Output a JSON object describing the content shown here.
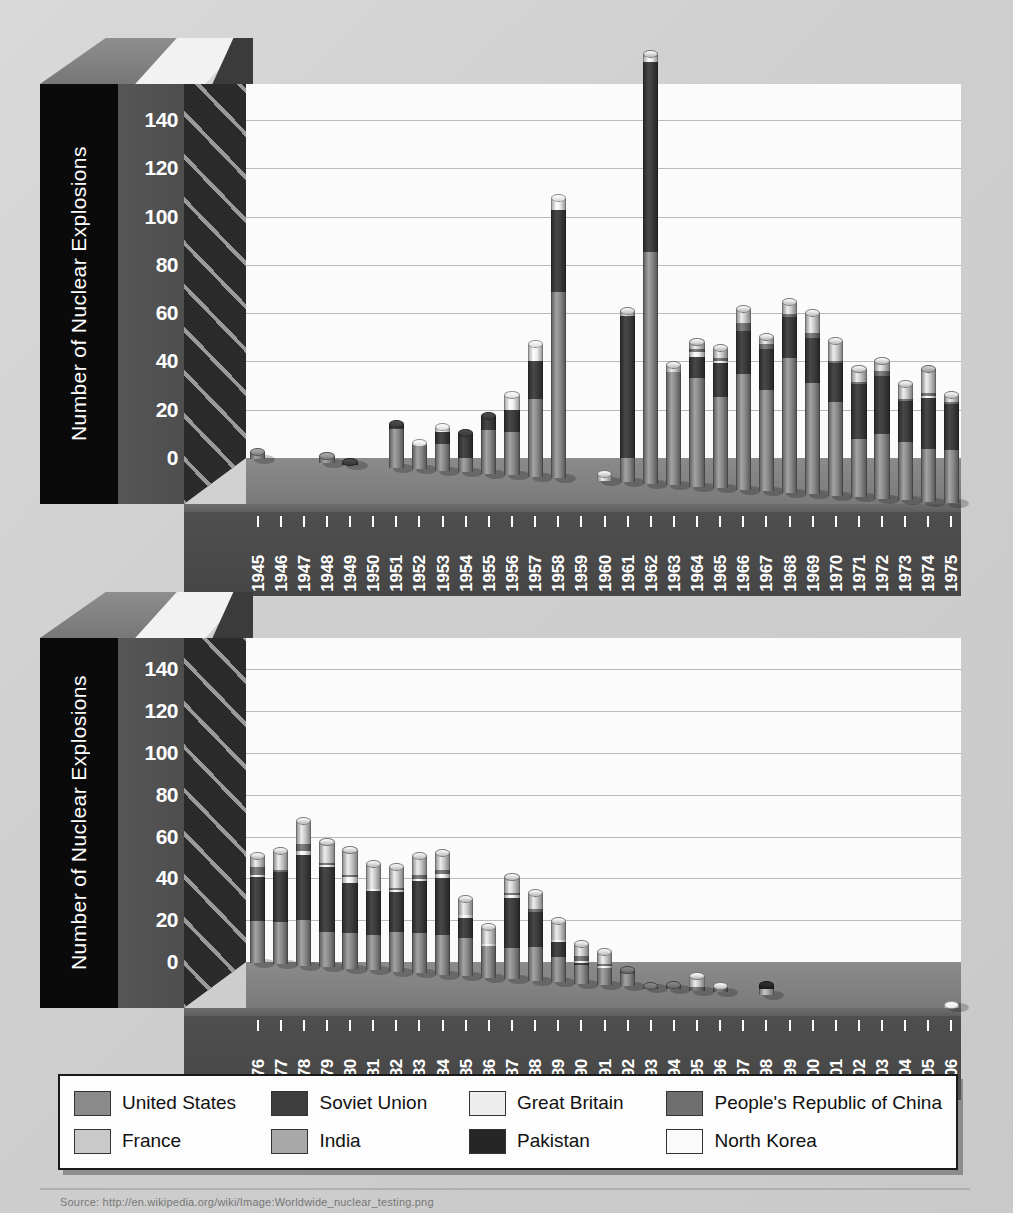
{
  "figure": {
    "background_color": "#d4d4d4",
    "caption": "Source: http://en.wikipedia.org/wiki/Image:Worldwide_nuclear_testing.png"
  },
  "legend": {
    "name": "country-legend",
    "items": [
      {
        "label": "United States",
        "color": "#8a8a8a"
      },
      {
        "label": "Soviet Union",
        "color": "#3d3d3d"
      },
      {
        "label": "Great Britain",
        "color": "#ededed"
      },
      {
        "label": "People's Republic of China",
        "color": "#6f6f6f"
      },
      {
        "label": "France",
        "color": "#c9c9c9"
      },
      {
        "label": "India",
        "color": "#a8a8a8"
      },
      {
        "label": "Pakistan",
        "color": "#262626"
      },
      {
        "label": "North Korea",
        "color": "#fbfbfb"
      }
    ]
  },
  "charts": [
    {
      "id": "chart-1945-1975",
      "ylabel": "Number of Nuclear Explosions",
      "yticks": [
        0,
        20,
        40,
        60,
        80,
        100,
        120,
        140
      ]
    },
    {
      "id": "chart-1976-2006",
      "ylabel": "Number of Nuclear Explosions",
      "yticks": [
        0,
        20,
        40,
        60,
        80,
        100,
        120,
        140
      ]
    }
  ],
  "chart_data": [
    {
      "type": "bar",
      "stacked": true,
      "title": "Worldwide nuclear explosions 1945-1975",
      "xlabel": "",
      "ylabel": "Number of Nuclear Explosions",
      "ylim": [
        0,
        155
      ],
      "yticks": [
        0,
        20,
        40,
        60,
        80,
        100,
        120,
        140
      ],
      "grid": true,
      "legend_position": "below-figure",
      "categories": [
        "1945",
        "1946",
        "1947",
        "1948",
        "1949",
        "1950",
        "1951",
        "1952",
        "1953",
        "1954",
        "1955",
        "1956",
        "1957",
        "1958",
        "1959",
        "1960",
        "1961",
        "1962",
        "1963",
        "1964",
        "1965",
        "1966",
        "1967",
        "1968",
        "1969",
        "1970",
        "1971",
        "1972",
        "1973",
        "1974",
        "1975"
      ],
      "series": [
        {
          "name": "United States",
          "color": "#8a8a8a",
          "values": [
            3,
            0,
            0,
            3,
            0,
            0,
            16,
            10,
            11,
            6,
            18,
            18,
            32,
            77,
            0,
            0,
            10,
            96,
            47,
            45,
            38,
            48,
            42,
            56,
            46,
            39,
            24,
            27,
            24,
            22,
            22
          ]
        },
        {
          "name": "Soviet Union",
          "color": "#3d3d3d",
          "values": [
            0,
            0,
            0,
            0,
            1,
            0,
            2,
            0,
            5,
            10,
            6,
            9,
            16,
            34,
            0,
            0,
            59,
            79,
            0,
            9,
            14,
            18,
            17,
            17,
            19,
            16,
            23,
            24,
            17,
            21,
            19
          ]
        },
        {
          "name": "Great Britain",
          "color": "#ededed",
          "values": [
            0,
            0,
            0,
            0,
            0,
            0,
            0,
            1,
            2,
            0,
            0,
            6,
            7,
            5,
            0,
            0,
            0,
            2,
            0,
            2,
            1,
            0,
            0,
            0,
            0,
            0,
            0,
            0,
            0,
            1,
            0
          ]
        },
        {
          "name": "People's Republic of China",
          "color": "#6f6f6f",
          "values": [
            0,
            0,
            0,
            0,
            0,
            0,
            0,
            0,
            0,
            0,
            0,
            0,
            0,
            0,
            0,
            0,
            0,
            0,
            0,
            1,
            1,
            3,
            2,
            1,
            2,
            1,
            1,
            2,
            1,
            1,
            1
          ]
        },
        {
          "name": "France",
          "color": "#c9c9c9",
          "values": [
            0,
            0,
            0,
            0,
            0,
            0,
            0,
            0,
            0,
            0,
            0,
            0,
            0,
            0,
            0,
            3,
            2,
            1,
            3,
            3,
            4,
            6,
            3,
            5,
            8,
            8,
            5,
            4,
            6,
            9,
            3
          ]
        },
        {
          "name": "India",
          "color": "#a8a8a8",
          "values": [
            0,
            0,
            0,
            0,
            0,
            0,
            0,
            0,
            0,
            0,
            0,
            0,
            0,
            0,
            0,
            0,
            0,
            0,
            0,
            0,
            0,
            0,
            0,
            0,
            0,
            0,
            0,
            0,
            0,
            1,
            0
          ]
        },
        {
          "name": "Pakistan",
          "color": "#262626",
          "values": [
            0,
            0,
            0,
            0,
            0,
            0,
            0,
            0,
            0,
            0,
            0,
            0,
            0,
            0,
            0,
            0,
            0,
            0,
            0,
            0,
            0,
            0,
            0,
            0,
            0,
            0,
            0,
            0,
            0,
            0,
            0
          ]
        },
        {
          "name": "North Korea",
          "color": "#fbfbfb",
          "values": [
            0,
            0,
            0,
            0,
            0,
            0,
            0,
            0,
            0,
            0,
            0,
            0,
            0,
            0,
            0,
            0,
            0,
            0,
            0,
            0,
            0,
            0,
            0,
            0,
            0,
            0,
            0,
            0,
            0,
            0,
            0
          ]
        }
      ],
      "totals": [
        3,
        0,
        0,
        3,
        1,
        0,
        18,
        11,
        18,
        16,
        24,
        33,
        55,
        116,
        0,
        3,
        71,
        178,
        50,
        60,
        58,
        75,
        64,
        79,
        75,
        64,
        53,
        57,
        48,
        55,
        45
      ]
    },
    {
      "type": "bar",
      "stacked": true,
      "title": "Worldwide nuclear explosions 1976-2006",
      "xlabel": "",
      "ylabel": "Number of Nuclear Explosions",
      "ylim": [
        0,
        155
      ],
      "yticks": [
        0,
        20,
        40,
        60,
        80,
        100,
        120,
        140
      ],
      "grid": true,
      "legend_position": "below-figure",
      "categories": [
        "1976",
        "1977",
        "1978",
        "1979",
        "1980",
        "1981",
        "1982",
        "1983",
        "1984",
        "1985",
        "1986",
        "1987",
        "1988",
        "1989",
        "1990",
        "1991",
        "1992",
        "1993",
        "1994",
        "1995",
        "1996",
        "1997",
        "1998",
        "1999",
        "2000",
        "2001",
        "2002",
        "2003",
        "2004",
        "2005",
        "2006"
      ],
      "series": [
        {
          "name": "United States",
          "color": "#8a8a8a",
          "values": [
            20,
            20,
            22,
            17,
            17,
            17,
            19,
            19,
            19,
            18,
            15,
            15,
            16,
            12,
            9,
            8,
            6,
            0,
            0,
            0,
            0,
            0,
            0,
            0,
            0,
            0,
            0,
            0,
            0,
            0,
            0
          ]
        },
        {
          "name": "Soviet Union",
          "color": "#3d3d3d",
          "values": [
            21,
            24,
            31,
            31,
            24,
            21,
            19,
            25,
            27,
            10,
            0,
            24,
            17,
            7,
            1,
            0,
            0,
            0,
            0,
            0,
            0,
            0,
            0,
            0,
            0,
            0,
            0,
            0,
            0,
            0,
            0
          ]
        },
        {
          "name": "Great Britain",
          "color": "#ededed",
          "values": [
            1,
            0,
            2,
            1,
            3,
            1,
            1,
            1,
            2,
            1,
            1,
            1,
            0,
            1,
            1,
            1,
            0,
            0,
            0,
            0,
            0,
            0,
            0,
            0,
            0,
            0,
            0,
            0,
            0,
            0,
            0
          ]
        },
        {
          "name": "People's Republic of China",
          "color": "#6f6f6f",
          "values": [
            4,
            1,
            3,
            1,
            1,
            0,
            1,
            2,
            2,
            0,
            0,
            1,
            1,
            0,
            2,
            1,
            2,
            1,
            2,
            2,
            2,
            0,
            0,
            0,
            0,
            0,
            0,
            0,
            0,
            0,
            0
          ]
        },
        {
          "name": "France",
          "color": "#c9c9c9",
          "values": [
            5,
            9,
            11,
            10,
            12,
            12,
            10,
            9,
            8,
            8,
            8,
            8,
            8,
            9,
            6,
            6,
            0,
            0,
            0,
            5,
            1,
            0,
            0,
            0,
            0,
            0,
            0,
            0,
            0,
            0,
            0
          ]
        },
        {
          "name": "India",
          "color": "#a8a8a8",
          "values": [
            0,
            0,
            0,
            0,
            0,
            0,
            0,
            0,
            0,
            0,
            0,
            0,
            0,
            0,
            0,
            0,
            0,
            0,
            0,
            0,
            0,
            0,
            3,
            0,
            0,
            0,
            0,
            0,
            0,
            0,
            0
          ]
        },
        {
          "name": "Pakistan",
          "color": "#262626",
          "values": [
            0,
            0,
            0,
            0,
            0,
            0,
            0,
            0,
            0,
            0,
            0,
            0,
            0,
            0,
            0,
            0,
            0,
            0,
            0,
            0,
            0,
            0,
            2,
            0,
            0,
            0,
            0,
            0,
            0,
            0,
            0
          ]
        },
        {
          "name": "North Korea",
          "color": "#fbfbfb",
          "values": [
            0,
            0,
            0,
            0,
            0,
            0,
            0,
            0,
            0,
            0,
            0,
            0,
            0,
            0,
            0,
            0,
            0,
            0,
            0,
            0,
            0,
            0,
            0,
            0,
            0,
            0,
            0,
            0,
            0,
            0,
            1
          ]
        }
      ],
      "totals": [
        51,
        54,
        69,
        60,
        57,
        51,
        50,
        56,
        58,
        37,
        24,
        49,
        42,
        29,
        19,
        16,
        8,
        1,
        2,
        7,
        3,
        0,
        5,
        0,
        0,
        0,
        0,
        0,
        0,
        0,
        1
      ]
    }
  ]
}
